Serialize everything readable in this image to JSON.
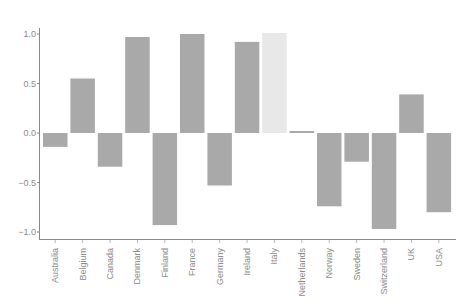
{
  "chart_data": {
    "type": "bar",
    "title": "",
    "xlabel": "",
    "ylabel": "",
    "ylim": [
      -1.1,
      1.1
    ],
    "yticks": [
      1.0,
      0.5,
      0.0,
      -0.5,
      -1.0
    ],
    "ytick_labels": [
      "1.0",
      "0.5",
      "0.0",
      "−0.5",
      "−1.0"
    ],
    "grid": false,
    "legend": null,
    "categories": [
      "Australia",
      "Belgium",
      "Canada",
      "Denmark",
      "Finland",
      "France",
      "Germany",
      "Ireland",
      "Italy",
      "Netherlands",
      "Norway",
      "Sweden",
      "Switzerland",
      "UK",
      "USA"
    ],
    "values": [
      -0.14,
      0.55,
      -0.34,
      0.97,
      -0.93,
      1.0,
      -0.53,
      0.92,
      1.01,
      0.02,
      -0.74,
      -0.29,
      -0.97,
      0.39,
      -0.8
    ],
    "highlighted_category": "Italy",
    "colors": {
      "bar": "#a9a9a9",
      "highlight": "#e8e8e8",
      "axis": "#888888",
      "text": "#8a8a8a"
    }
  }
}
